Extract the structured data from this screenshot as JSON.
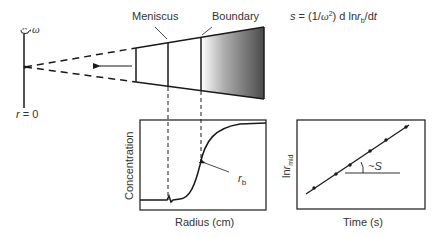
{
  "rotor": {
    "omega_label": "ω",
    "axis_label_var": "r",
    "axis_label_rest": " = 0"
  },
  "cell": {
    "meniscus_label": "Meniscus",
    "boundary_label": "Boundary"
  },
  "equation": {
    "s": "s",
    "eq": " = (1/",
    "omega": "ω",
    "sq": "2",
    "rest1": ") d ln",
    "r": "r",
    "sub_b": "b",
    "rest2": "/d",
    "t": "t"
  },
  "plot_left": {
    "xlabel": "Radius (cm)",
    "ylabel": "Concentration",
    "annotation_r": "r",
    "annotation_sub": "b"
  },
  "plot_right": {
    "xlabel": "Time (s)",
    "ylabel_main": "ln",
    "ylabel_r": "r",
    "ylabel_sub": "mid",
    "slope_label": "~S"
  },
  "colors": {
    "line": "#1a1a1a",
    "gradient_start": "#ffffff",
    "gradient_end": "#555555"
  }
}
